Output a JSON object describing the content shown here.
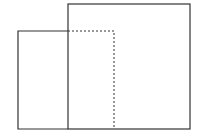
{
  "diagram": {
    "width": 198,
    "height": 140,
    "stroke_color": "#333333",
    "dashed_color": "#333333",
    "shapes": [
      {
        "id": "large-rectangle",
        "style": "solid",
        "x": 68,
        "y": 4,
        "width": 122,
        "height": 125
      },
      {
        "id": "small-rectangle-visible",
        "style": "solid",
        "points": [
          [
            68,
            31
          ],
          [
            18,
            31
          ],
          [
            18,
            129
          ],
          [
            68,
            129
          ]
        ]
      },
      {
        "id": "small-rectangle-hidden",
        "style": "dashed",
        "points": [
          [
            68,
            31
          ],
          [
            114,
            31
          ],
          [
            114,
            129
          ]
        ]
      }
    ]
  }
}
